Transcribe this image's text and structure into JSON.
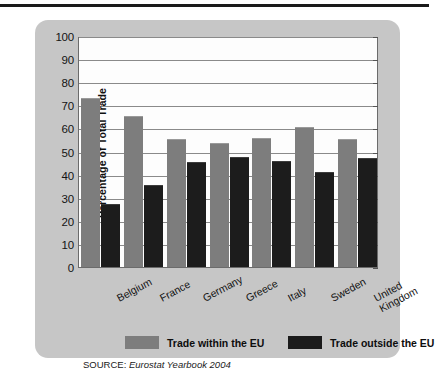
{
  "chart_data": {
    "type": "bar",
    "title": "",
    "xlabel": "",
    "ylabel": "Percentage of Total Trade",
    "ylim": [
      0,
      100
    ],
    "yticks": [
      0,
      10,
      20,
      30,
      40,
      50,
      60,
      70,
      80,
      90,
      100
    ],
    "grid": true,
    "legend_position": "bottom",
    "categories": [
      "Belgium",
      "France",
      "Germany",
      "Greece",
      "Italy",
      "Sweden",
      "United Kingdom"
    ],
    "category_lines": [
      [
        "Belgium"
      ],
      [
        "France"
      ],
      [
        "Germany"
      ],
      [
        "Greece"
      ],
      [
        "Italy"
      ],
      [
        "Sweden"
      ],
      [
        "United",
        "Kingdom"
      ]
    ],
    "series": [
      {
        "name": "Trade within the EU",
        "color": "#7d7d7d",
        "values": [
          74,
          66,
          56,
          54,
          56.5,
          61,
          56
        ]
      },
      {
        "name": "Trade outside the EU",
        "color": "#1b1b1b",
        "values": [
          27.5,
          36,
          46,
          48,
          46.5,
          41.5,
          47.5
        ]
      }
    ],
    "source_label": "SOURCE:",
    "source_reference": "Eurostat Yearbook 2004"
  },
  "panel": {
    "background_color": "#c6c6c6",
    "plot_background_color": "#fdfdfd"
  }
}
